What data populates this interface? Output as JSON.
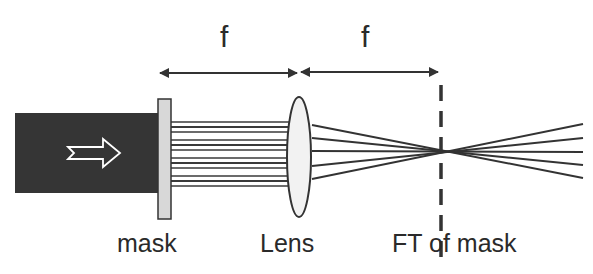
{
  "diagram": {
    "labels": {
      "focal_length_1": "f",
      "focal_length_2": "f",
      "mask": "mask",
      "lens": "Lens",
      "ft_plane": "FT of mask"
    },
    "elements": [
      {
        "name": "input-beam",
        "type": "dark rectangle with hollow arrow",
        "icon": "hollow-right-arrow-icon"
      },
      {
        "name": "mask",
        "type": "light gray vertical bar"
      },
      {
        "name": "parallel-rays",
        "type": "horizontal lines between mask and lens"
      },
      {
        "name": "lens",
        "type": "ellipse"
      },
      {
        "name": "converging-rays",
        "type": "lines converging to focal point and diverging"
      },
      {
        "name": "ft-plane",
        "type": "vertical dashed line at back focal plane"
      },
      {
        "name": "distance-arrows",
        "type": "double-headed arrows labeled f"
      }
    ],
    "colors": {
      "beam": "#353535",
      "mask_fill": "#d8d8d8",
      "lens_fill": "#f2f2f2",
      "line": "#333333",
      "background": "#ffffff"
    }
  }
}
